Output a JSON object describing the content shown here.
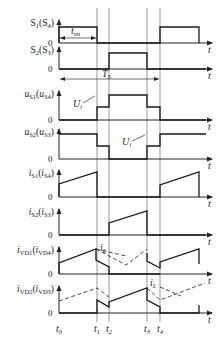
{
  "figure": {
    "type": "switching-timing-diagram",
    "time_axis_label": "t",
    "zero_label": "0"
  },
  "time_markers": [
    {
      "id": "t0",
      "label": "t",
      "sub": "0",
      "x": 59
    },
    {
      "id": "t1",
      "label": "t",
      "sub": "1",
      "x": 97
    },
    {
      "id": "t2",
      "label": "t",
      "sub": "2",
      "x": 109
    },
    {
      "id": "t3",
      "label": "t",
      "sub": "3",
      "x": 147
    },
    {
      "id": "t4",
      "label": "t",
      "sub": "4",
      "x": 160
    }
  ],
  "annotations": {
    "t_on": {
      "label": "t",
      "sub": "on"
    },
    "T_s": {
      "label": "T",
      "sub": "S"
    },
    "U_i_1": {
      "label": "U",
      "sub": "i"
    },
    "U_i_2": {
      "label": "U",
      "sub": "i"
    },
    "i_L_1": {
      "label": "i",
      "sub": "L"
    },
    "i_L_2": {
      "label": "i",
      "sub": "L"
    }
  },
  "traces": [
    {
      "name": "S1(S4)",
      "main": "S",
      "main_sub": "1",
      "paren": "S",
      "paren_sub": "4",
      "baseline_y": 43,
      "label_y": 22,
      "points": [
        [
          59,
          43
        ],
        [
          59,
          27
        ],
        [
          97,
          27
        ],
        [
          97,
          43
        ],
        [
          160,
          43
        ],
        [
          160,
          27
        ],
        [
          199,
          27
        ],
        [
          199,
          43
        ]
      ]
    },
    {
      "name": "S2(S3)",
      "main": "S",
      "main_sub": "2",
      "paren": "S",
      "paren_sub": "3",
      "baseline_y": 69,
      "label_y": 49,
      "points": [
        [
          59,
          69
        ],
        [
          109,
          69
        ],
        [
          109,
          53
        ],
        [
          147,
          53
        ],
        [
          147,
          69
        ],
        [
          206,
          69
        ]
      ]
    },
    {
      "name": "uS1(uS4)",
      "main": "u",
      "main_sub": "S1",
      "paren": "u",
      "paren_sub": "S4",
      "baseline_y": 120,
      "label_y": 93,
      "points": [
        [
          59,
          120
        ],
        [
          97,
          120
        ],
        [
          97,
          107
        ],
        [
          109,
          107
        ],
        [
          109,
          95
        ],
        [
          147,
          95
        ],
        [
          147,
          107
        ],
        [
          160,
          107
        ],
        [
          160,
          120
        ],
        [
          206,
          120
        ]
      ]
    },
    {
      "name": "uS2(uS3)",
      "main": "u",
      "main_sub": "S2",
      "paren": "u",
      "paren_sub": "S3",
      "baseline_y": 159,
      "label_y": 131,
      "points": [
        [
          59,
          134
        ],
        [
          97,
          134
        ],
        [
          97,
          146
        ],
        [
          109,
          146
        ],
        [
          109,
          159
        ],
        [
          147,
          159
        ],
        [
          147,
          146
        ],
        [
          160,
          146
        ],
        [
          160,
          134
        ],
        [
          206,
          134
        ]
      ]
    },
    {
      "name": "iS1(iS4)",
      "main": "i",
      "main_sub": "S1",
      "paren": "i",
      "paren_sub": "S4",
      "baseline_y": 197,
      "label_y": 172,
      "points": [
        [
          59,
          197
        ],
        [
          59,
          184
        ],
        [
          97,
          172
        ],
        [
          97,
          197
        ],
        [
          160,
          197
        ],
        [
          160,
          185
        ],
        [
          199,
          172
        ],
        [
          199,
          197
        ]
      ]
    },
    {
      "name": "iS2(iS3)",
      "main": "i",
      "main_sub": "S2",
      "paren": "i",
      "paren_sub": "S3",
      "baseline_y": 235,
      "label_y": 211,
      "points": [
        [
          59,
          235
        ],
        [
          109,
          235
        ],
        [
          109,
          223
        ],
        [
          147,
          211
        ],
        [
          147,
          235
        ],
        [
          206,
          235
        ]
      ]
    },
    {
      "name": "iVD1(iVD4)",
      "main": "i",
      "main_sub": "VD1",
      "paren": "i",
      "paren_sub": "VD4",
      "baseline_y": 274,
      "label_y": 249,
      "points": [
        [
          59,
          274
        ],
        [
          59,
          263
        ],
        [
          96,
          249
        ],
        [
          96,
          260
        ],
        [
          109,
          267
        ],
        [
          109,
          274
        ],
        [
          160,
          274
        ]
      ],
      "points2": [
        [
          147,
          253
        ],
        [
          147,
          261
        ],
        [
          160,
          268
        ],
        [
          160,
          262
        ],
        [
          199,
          249
        ],
        [
          199,
          264
        ]
      ],
      "dashed": [
        [
          96,
          249
        ],
        [
          126,
          265
        ],
        [
          147,
          249
        ]
      ],
      "dashed2": [
        [
          96,
          249
        ],
        [
          126,
          256
        ]
      ]
    },
    {
      "name": "iVD2(iVD3)",
      "main": "i",
      "main_sub": "VD2",
      "paren": "i",
      "paren_sub": "VD3",
      "baseline_y": 313,
      "label_y": 288,
      "points": [
        [
          59,
          313
        ],
        [
          97,
          313
        ],
        [
          97,
          300
        ],
        [
          109,
          307
        ],
        [
          109,
          302
        ],
        [
          147,
          288
        ],
        [
          147,
          300
        ],
        [
          160,
          307
        ],
        [
          160,
          313
        ],
        [
          199,
          313
        ],
        [
          199,
          305
        ]
      ],
      "dashed": [
        [
          59,
          301
        ],
        [
          97,
          288
        ],
        [
          109,
          297
        ]
      ],
      "dashed2": [
        [
          147,
          288
        ],
        [
          160,
          300
        ],
        [
          205,
          283
        ]
      ],
      "dashed3": [
        [
          160,
          287
        ],
        [
          181,
          296
        ]
      ]
    }
  ]
}
